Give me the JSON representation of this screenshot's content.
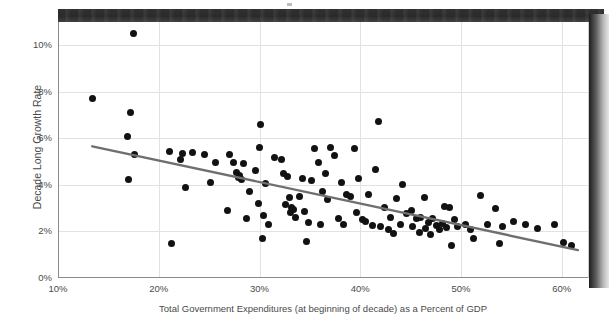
{
  "chart_data": {
    "type": "scatter",
    "title": "",
    "xlabel": "Total Government Expenditures (at beginning of decade) as a Percent of GDP",
    "ylabel": "Decade Long Growth Rate",
    "xlim": [
      10,
      62.6
    ],
    "ylim": [
      0,
      11.0
    ],
    "xticks": [
      10,
      20,
      30,
      40,
      50,
      60
    ],
    "xtick_labels": [
      "10%",
      "20%",
      "30%",
      "40%",
      "50%",
      "60%"
    ],
    "yticks": [
      0,
      2,
      4,
      6,
      8,
      10
    ],
    "ytick_labels": [
      "0%",
      "2%",
      "4%",
      "6%",
      "8%",
      "10%"
    ],
    "grid": true,
    "legend": false,
    "marker_color": "#121212",
    "trendline_color": "#6f6f6f",
    "series": [
      {
        "name": "Decade observations",
        "points": [
          [
            13.4,
            7.72
          ],
          [
            17.5,
            10.52
          ],
          [
            17.2,
            7.12
          ],
          [
            16.9,
            6.1
          ],
          [
            17.0,
            4.25
          ],
          [
            17.6,
            5.3
          ],
          [
            21.1,
            5.45
          ],
          [
            22.4,
            5.35
          ],
          [
            23.3,
            5.38
          ],
          [
            22.2,
            5.08
          ],
          [
            22.6,
            3.88
          ],
          [
            21.3,
            1.48
          ],
          [
            24.5,
            5.33
          ],
          [
            25.6,
            4.95
          ],
          [
            25.1,
            4.1
          ],
          [
            27.0,
            5.3
          ],
          [
            27.4,
            4.95
          ],
          [
            27.7,
            4.52
          ],
          [
            28.0,
            4.4
          ],
          [
            27.9,
            4.3
          ],
          [
            28.2,
            4.22
          ],
          [
            28.4,
            4.92
          ],
          [
            29.0,
            3.72
          ],
          [
            26.8,
            2.92
          ],
          [
            28.7,
            2.55
          ],
          [
            30.1,
            6.58
          ],
          [
            30.0,
            5.6
          ],
          [
            29.6,
            4.62
          ],
          [
            30.6,
            4.05
          ],
          [
            29.9,
            3.22
          ],
          [
            30.4,
            2.7
          ],
          [
            31.5,
            5.18
          ],
          [
            30.9,
            2.3
          ],
          [
            30.3,
            1.72
          ],
          [
            32.2,
            5.1
          ],
          [
            32.4,
            4.48
          ],
          [
            32.8,
            4.35
          ],
          [
            33.0,
            3.48
          ],
          [
            32.6,
            3.18
          ],
          [
            33.2,
            3.05
          ],
          [
            33.4,
            2.95
          ],
          [
            33.1,
            2.8
          ],
          [
            33.6,
            2.62
          ],
          [
            34.3,
            4.28
          ],
          [
            34.0,
            3.5
          ],
          [
            34.5,
            2.88
          ],
          [
            34.9,
            2.38
          ],
          [
            34.7,
            1.58
          ],
          [
            35.5,
            5.55
          ],
          [
            35.8,
            4.95
          ],
          [
            35.2,
            4.2
          ],
          [
            36.2,
            3.72
          ],
          [
            36.7,
            3.38
          ],
          [
            36.0,
            2.3
          ],
          [
            37.0,
            5.62
          ],
          [
            37.4,
            5.28
          ],
          [
            36.5,
            4.5
          ],
          [
            38.1,
            4.12
          ],
          [
            38.6,
            3.58
          ],
          [
            37.8,
            2.55
          ],
          [
            38.3,
            2.32
          ],
          [
            39.4,
            5.55
          ],
          [
            39.8,
            4.28
          ],
          [
            39.0,
            3.52
          ],
          [
            39.6,
            2.82
          ],
          [
            40.2,
            2.5
          ],
          [
            40.8,
            3.6
          ],
          [
            40.5,
            2.42
          ],
          [
            41.2,
            2.25
          ],
          [
            41.8,
            6.72
          ],
          [
            41.5,
            4.68
          ],
          [
            42.4,
            3.05
          ],
          [
            42.0,
            2.2
          ],
          [
            42.8,
            2.08
          ],
          [
            43.6,
            3.42
          ],
          [
            43.0,
            2.62
          ],
          [
            43.3,
            1.92
          ],
          [
            44.2,
            4.0
          ],
          [
            44.6,
            2.78
          ],
          [
            44.0,
            2.32
          ],
          [
            45.1,
            2.92
          ],
          [
            45.6,
            2.55
          ],
          [
            45.2,
            2.2
          ],
          [
            45.9,
            1.95
          ],
          [
            46.4,
            3.45
          ],
          [
            46.0,
            2.62
          ],
          [
            46.8,
            2.38
          ],
          [
            46.5,
            2.12
          ],
          [
            47.2,
            2.55
          ],
          [
            47.6,
            2.25
          ],
          [
            47.0,
            1.88
          ],
          [
            47.9,
            2.08
          ],
          [
            48.4,
            3.08
          ],
          [
            48.8,
            3.02
          ],
          [
            48.2,
            2.35
          ],
          [
            48.6,
            2.18
          ],
          [
            49.3,
            2.52
          ],
          [
            49.6,
            2.2
          ],
          [
            49.0,
            1.42
          ],
          [
            50.4,
            2.32
          ],
          [
            50.9,
            2.1
          ],
          [
            51.2,
            1.7
          ],
          [
            51.9,
            3.55
          ],
          [
            52.6,
            2.3
          ],
          [
            53.4,
            2.98
          ],
          [
            54.1,
            2.22
          ],
          [
            53.8,
            1.48
          ],
          [
            55.2,
            2.42
          ],
          [
            56.4,
            2.28
          ],
          [
            57.6,
            2.12
          ],
          [
            59.3,
            2.32
          ],
          [
            60.2,
            1.52
          ],
          [
            61.0,
            1.38
          ]
        ]
      }
    ],
    "trendline": {
      "name": "linear fit",
      "x_start": 13.4,
      "y_start": 5.66,
      "x_end": 61.6,
      "y_end": 1.2
    }
  },
  "artifacts": {
    "top_band_label": "scan-shadow-band",
    "right_shadow_label": "page-edge-shadow"
  }
}
